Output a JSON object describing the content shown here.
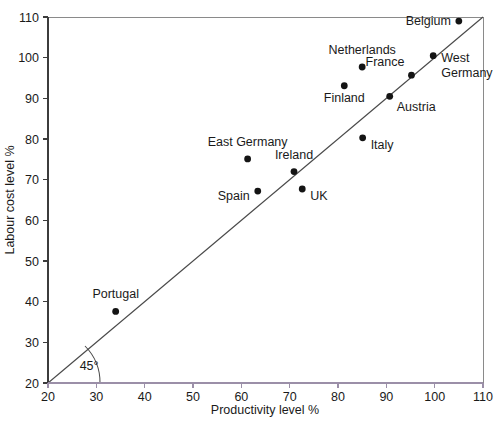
{
  "figure": {
    "background_color": "#ffffff",
    "point_color": "#141414",
    "axis_color": "#3c3c3c",
    "x_axis_color": "#9b8fa8",
    "diagonal_color": "#4a4a4a"
  },
  "chart_data": {
    "type": "scatter",
    "title": "",
    "xlabel": "Productivity level %",
    "ylabel": "Labour cost level %",
    "xlim": [
      20,
      110
    ],
    "ylim": [
      20,
      110
    ],
    "xticks": [
      20,
      30,
      40,
      50,
      60,
      70,
      80,
      90,
      100,
      110
    ],
    "yticks": [
      20,
      30,
      40,
      50,
      60,
      70,
      80,
      90,
      100,
      110
    ],
    "grid": false,
    "legend": null,
    "annotations": [
      {
        "text": "45°",
        "x": 28.5,
        "y": 23.2
      }
    ],
    "reference_line": {
      "type": "identity",
      "label": "45° line",
      "from": [
        20,
        20
      ],
      "to": [
        110,
        110
      ]
    },
    "points": [
      {
        "label": "Portugal",
        "x": 34.0,
        "y": 37.6,
        "label_dx": 0,
        "label_dy": -13,
        "anchor": "middle"
      },
      {
        "label": "Spain",
        "x": 63.4,
        "y": 67.2,
        "label_dx": -8,
        "label_dy": 9,
        "anchor": "end"
      },
      {
        "label": "East Germany",
        "x": 61.3,
        "y": 75.1,
        "label_dx": 0,
        "label_dy": -13,
        "anchor": "middle"
      },
      {
        "label": "Ireland",
        "x": 70.9,
        "y": 72.0,
        "label_dx": 0,
        "label_dy": -13,
        "anchor": "middle"
      },
      {
        "label": "UK",
        "x": 72.6,
        "y": 67.7,
        "label_dx": 8,
        "label_dy": 11,
        "anchor": "start"
      },
      {
        "label": "Italy",
        "x": 85.1,
        "y": 80.3,
        "label_dx": 8,
        "label_dy": 11,
        "anchor": "start"
      },
      {
        "label": "Finland",
        "x": 81.3,
        "y": 93.1,
        "label_dx": 0,
        "label_dy": 16,
        "anchor": "middle"
      },
      {
        "label": "Netherlands",
        "x": 85.0,
        "y": 97.7,
        "label_dx": 0,
        "label_dy": -13,
        "anchor": "middle"
      },
      {
        "label": "Austria",
        "x": 90.7,
        "y": 90.5,
        "label_dx": 7,
        "label_dy": 15,
        "anchor": "start"
      },
      {
        "label": "France",
        "x": 95.2,
        "y": 95.7,
        "label_dx": -7,
        "label_dy": -9,
        "anchor": "end"
      },
      {
        "label": "West Germany",
        "x": 99.7,
        "y": 100.5,
        "label_dx": 8,
        "label_dy": 6,
        "anchor": "start",
        "multiline": [
          "West",
          "Germany"
        ]
      },
      {
        "label": "Belgium",
        "x": 105.0,
        "y": 109.0,
        "label_dx": -8,
        "label_dy": 4,
        "anchor": "end"
      }
    ]
  },
  "caption": {
    "ghost_text": ""
  }
}
